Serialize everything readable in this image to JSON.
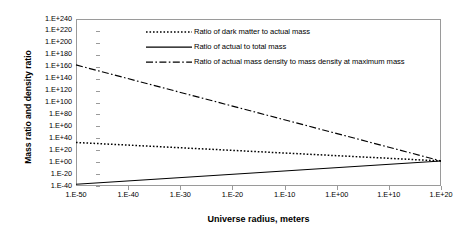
{
  "chart_data": {
    "type": "line",
    "title": "",
    "xlabel": "Universe radius, meters",
    "ylabel": "Mass ratio and density ratio",
    "grid": false,
    "legend_position": "top-center inside plot",
    "x_scale": "log10-exponent",
    "y_scale": "log10-exponent",
    "xlim": [
      -50,
      20
    ],
    "ylim": [
      -40,
      240
    ],
    "x_tick_labels": [
      "1.E-50",
      "1.E-40",
      "1.E-30",
      "1.E-20",
      "1.E-10",
      "1.E+00",
      "1.E+10",
      "1.E+20"
    ],
    "x_tick_exponents": [
      -50,
      -40,
      -30,
      -20,
      -10,
      0,
      10,
      20
    ],
    "y_tick_labels": [
      "1.E+240",
      "1.E+220",
      "1.E+200",
      "1.E+180",
      "1.E+160",
      "1.E+140",
      "1.E+120",
      "1.E+100",
      "1.E+80",
      "1.E+60",
      "1.E+40",
      "1.E+20",
      "1.E+00",
      "1.E-20",
      "1.E-40"
    ],
    "y_tick_exponents": [
      240,
      220,
      200,
      180,
      160,
      140,
      120,
      100,
      80,
      60,
      40,
      20,
      0,
      -20,
      -40
    ],
    "series": [
      {
        "name": "Ratio of dark matter to actual mass",
        "style": "dotted",
        "color": "#000000",
        "x": [
          -50,
          20
        ],
        "y": [
          33,
          2
        ]
      },
      {
        "name": "Ratio of actual to total mass",
        "style": "solid",
        "color": "#000000",
        "x": [
          -50,
          20
        ],
        "y": [
          -37,
          2
        ]
      },
      {
        "name": "Ratio of actual mass density to mass density at maximum mass",
        "style": "dash-dot",
        "color": "#000000",
        "x": [
          -50,
          20
        ],
        "y": [
          163,
          2
        ]
      }
    ]
  },
  "axis": {
    "x_title": "Universe radius, meters",
    "y_title": "Mass ratio and density ratio"
  },
  "legend": {
    "entries": [
      {
        "label": "Ratio of dark matter to actual mass",
        "style": "dotted"
      },
      {
        "label": "Ratio of actual to total mass",
        "style": "solid"
      },
      {
        "label": "Ratio of actual mass density to mass density at maximum mass",
        "style": "dash-dot"
      }
    ]
  },
  "colors": {
    "series_line": "#000000",
    "frame": "#9a9a9a",
    "background": "#ffffff"
  }
}
